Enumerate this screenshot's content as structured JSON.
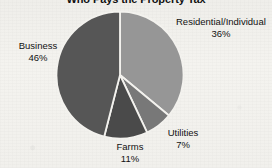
{
  "chart_title": "Who Pays the Property Tax",
  "chart_data": {
    "type": "pie",
    "title": "Who Pays the Property Tax",
    "xlabel": "",
    "ylabel": "",
    "legend_position": "none",
    "labels_inline": true,
    "start_angle_deg": 0,
    "direction": "clockwise",
    "categories": [
      "Residential/Individual",
      "Utilities",
      "Farms",
      "Business"
    ],
    "values": [
      36,
      7,
      11,
      46
    ],
    "unit": "%",
    "slice_colors": [
      "#969696",
      "#787878",
      "#4a4a4a",
      "#565656"
    ],
    "separator_color": "#f3f2ee",
    "slices": [
      {
        "label": "Residential/Individual",
        "value": 36,
        "display": "36%",
        "color": "#969696"
      },
      {
        "label": "Utilities",
        "value": 7,
        "display": "7%",
        "color": "#787878"
      },
      {
        "label": "Farms",
        "value": 11,
        "display": "11%",
        "color": "#4a4a4a"
      },
      {
        "label": "Business",
        "value": 46,
        "display": "46%",
        "color": "#565656"
      }
    ]
  },
  "labels": {
    "residential": {
      "name": "Residential/Individual",
      "pct": "36%"
    },
    "business": {
      "name": "Business",
      "pct": "46%"
    },
    "utilities": {
      "name": "Utilities",
      "pct": "7%"
    },
    "farms": {
      "name": "Farms",
      "pct": "11%"
    }
  }
}
